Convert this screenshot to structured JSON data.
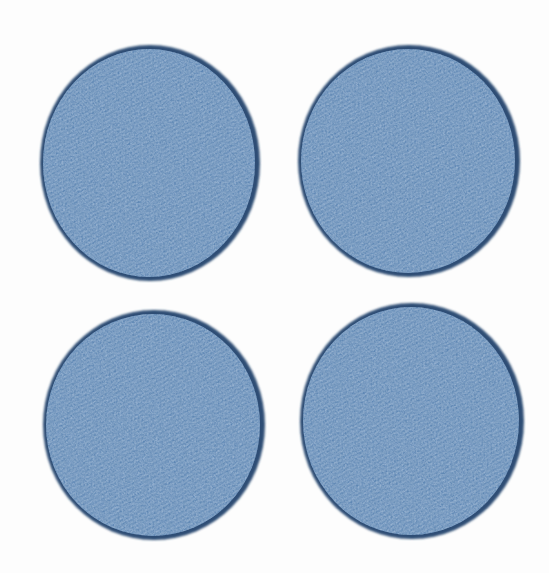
{
  "scene": {
    "description": "Four circular blue denim fabric patches with dark stitched edges arranged in a two-by-two grid on a white background",
    "item_count": 4,
    "items": [
      {
        "label": "denim patch top left"
      },
      {
        "label": "denim patch top right"
      },
      {
        "label": "denim patch bottom left"
      },
      {
        "label": "denim patch bottom right"
      }
    ]
  },
  "colors": {
    "background": "#fdfdfd",
    "patch_fill": "#5d86b4",
    "patch_fill_light_speckle": "#8aa8cb",
    "patch_fill_dark_speckle": "#44699a",
    "patch_edge": "#2e4e74"
  }
}
